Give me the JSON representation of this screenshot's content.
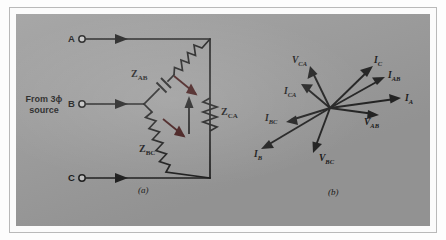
{
  "figure": {
    "caption_a": "(a)",
    "caption_b": "(b)",
    "circuit": {
      "source_label_line1": "From 3ϕ",
      "source_label_line2": "source",
      "terminals": [
        {
          "name": "terminal-a",
          "label": "A"
        },
        {
          "name": "terminal-b",
          "label": "B"
        },
        {
          "name": "terminal-c",
          "label": "C"
        }
      ],
      "impedances": [
        {
          "name": "impedance-zab",
          "symbol": "Z",
          "sub": "AB"
        },
        {
          "name": "impedance-zbc",
          "symbol": "Z",
          "sub": "BC"
        },
        {
          "name": "impedance-zca",
          "symbol": "Z",
          "sub": "CA"
        }
      ]
    },
    "phasor": {
      "vectors": [
        {
          "name": "phasor-vca",
          "symbol": "V",
          "sub": "CA"
        },
        {
          "name": "phasor-ic",
          "symbol": "I",
          "sub": "C"
        },
        {
          "name": "phasor-iab",
          "symbol": "I",
          "sub": "AB"
        },
        {
          "name": "phasor-ica",
          "symbol": "I",
          "sub": "CA"
        },
        {
          "name": "phasor-ia",
          "symbol": "I",
          "sub": "A"
        },
        {
          "name": "phasor-vab",
          "symbol": "V",
          "sub": "AB"
        },
        {
          "name": "phasor-ibc",
          "symbol": "I",
          "sub": "BC"
        },
        {
          "name": "phasor-vbc",
          "symbol": "V",
          "sub": "BC"
        },
        {
          "name": "phasor-ib",
          "symbol": "I",
          "sub": "B"
        }
      ]
    }
  }
}
